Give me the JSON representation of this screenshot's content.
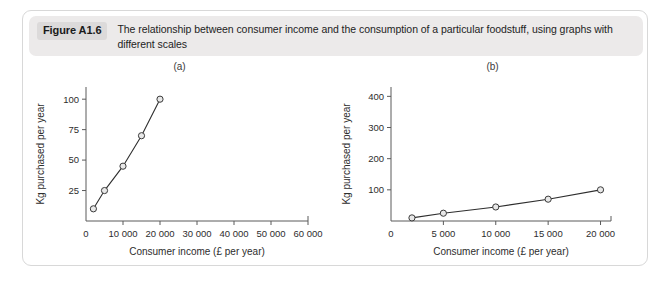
{
  "figure": {
    "badge": "Figure A1.6",
    "caption": "The relationship between consumer income and the consumption of a particular foodstuff, using graphs with different scales"
  },
  "colors": {
    "caption_background": "#eceaea",
    "badge_background": "#dcdada",
    "panel_border": "#d8d8d8",
    "line": "#2e2e2e",
    "marker_fill": "#e8e8e8",
    "axis": "#5a5a5a"
  },
  "chart_data": [
    {
      "type": "line",
      "title": "(a)",
      "xlabel": "Consumer income (£ per year)",
      "ylabel": "Kg purchased per year",
      "x": [
        2000,
        5000,
        10000,
        15000,
        20000
      ],
      "values": [
        10,
        25,
        45,
        70,
        100
      ],
      "xlim": [
        0,
        60000
      ],
      "ylim": [
        0,
        110
      ],
      "xticks": [
        0,
        10000,
        20000,
        30000,
        40000,
        50000,
        60000
      ],
      "xticklabels": [
        "0",
        "10 000",
        "20 000",
        "30 000",
        "40 000",
        "50 000",
        "60 000"
      ],
      "yticks": [
        25,
        50,
        75,
        100
      ],
      "yticklabels": [
        "25",
        "50",
        "75",
        "100"
      ],
      "grid": false,
      "legend": "none",
      "markers": "open-circle"
    },
    {
      "type": "line",
      "title": "(b)",
      "xlabel": "Consumer income (£ per year)",
      "ylabel": "Kg purchased per year",
      "x": [
        2000,
        5000,
        10000,
        15000,
        20000
      ],
      "values": [
        10,
        25,
        45,
        70,
        100
      ],
      "xlim": [
        0,
        21000
      ],
      "ylim": [
        0,
        430
      ],
      "xticks": [
        0,
        5000,
        10000,
        15000,
        20000
      ],
      "xticklabels": [
        "0",
        "5 000",
        "10 000",
        "15 000",
        "20 000"
      ],
      "yticks": [
        100,
        200,
        300,
        400
      ],
      "yticklabels": [
        "100",
        "200",
        "300",
        "400"
      ],
      "grid": false,
      "legend": "none",
      "markers": "open-circle"
    }
  ]
}
